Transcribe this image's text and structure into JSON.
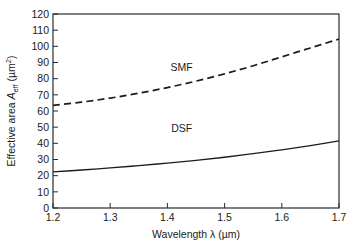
{
  "chart_data": {
    "type": "line",
    "title": "",
    "xlabel": "Wavelength λ (µm)",
    "ylabel": "Effective area A_eff (µm^2)",
    "xlabel_parts": {
      "main": "Wavelength ",
      "symbol": "λ",
      "units": " (µm)"
    },
    "ylabel_parts": {
      "main": "Effective area ",
      "symbol": "A",
      "subscript": "eff",
      "units_open": " (µm",
      "superscript": "2",
      "units_close": ")"
    },
    "xlim": [
      1.2,
      1.7
    ],
    "ylim": [
      0,
      120
    ],
    "xticks": [
      1.2,
      1.3,
      1.4,
      1.5,
      1.6,
      1.7
    ],
    "xtick_labels": [
      "1.2",
      "1.3",
      "1.4",
      "1.5",
      "1.6",
      "1.7"
    ],
    "yticks": [
      0,
      10,
      20,
      30,
      40,
      50,
      60,
      70,
      80,
      90,
      100,
      110,
      120
    ],
    "ytick_labels": [
      "0",
      "10",
      "20",
      "30",
      "40",
      "50",
      "60",
      "70",
      "80",
      "90",
      "100",
      "110",
      "120"
    ],
    "grid": false,
    "legend": "inline-annotations",
    "line_color": "#1c1c1c",
    "axis_color": "#2b2b2b",
    "background": "#ffffff",
    "series": [
      {
        "name": "SMF",
        "style": "dashed",
        "label_position": {
          "x": 1.425,
          "y": 85
        },
        "x": [
          1.2,
          1.25,
          1.3,
          1.35,
          1.4,
          1.45,
          1.5,
          1.55,
          1.6,
          1.65,
          1.7
        ],
        "values": [
          63.5,
          65.5,
          68.0,
          71.0,
          74.5,
          78.5,
          83.0,
          88.0,
          93.5,
          99.0,
          104.5
        ]
      },
      {
        "name": "DSF",
        "style": "solid",
        "label_position": {
          "x": 1.425,
          "y": 47
        },
        "x": [
          1.2,
          1.25,
          1.3,
          1.35,
          1.4,
          1.45,
          1.5,
          1.55,
          1.6,
          1.65,
          1.7
        ],
        "values": [
          22.3,
          23.5,
          24.8,
          26.2,
          27.8,
          29.5,
          31.4,
          33.6,
          36.0,
          38.6,
          41.5
        ]
      }
    ],
    "annotations": [
      {
        "text": "SMF",
        "x": 1.425,
        "y": 85
      },
      {
        "text": "DSF",
        "x": 1.425,
        "y": 47
      }
    ]
  }
}
